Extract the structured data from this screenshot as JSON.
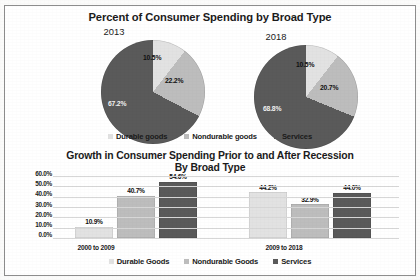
{
  "colors": {
    "durable": "#e2e2e2",
    "nondurable": "#bdbdbd",
    "services": "#5a5a5a",
    "grid": "#d7d7d7",
    "text": "#1b1b1b"
  },
  "pie_panel": {
    "title": "Percent of Consumer Spending by Broad Type",
    "charts": [
      {
        "year": "2013",
        "labels": [
          "10.5%",
          "22.2%",
          "67.2%"
        ]
      },
      {
        "year": "2018",
        "labels": [
          "10.5%",
          "20.7%",
          "68.8%"
        ]
      }
    ],
    "legend": [
      "Durable goods",
      "Nondurable goods",
      "Services"
    ]
  },
  "bar_panel": {
    "title_line1": "Growth in Consumer Spending Prior to and After Recession",
    "title_line2": "By Broad Type",
    "yticks": [
      "60.0%",
      "50.0%",
      "40.0%",
      "30.0%",
      "20.0%",
      "10.0%",
      "0.0%"
    ],
    "categories": [
      "2000 to 2009",
      "2009 to 2018"
    ],
    "legend": [
      "Durable Goods",
      "Nondurable Goods",
      "Services"
    ],
    "labels": {
      "g0": [
        "10.9%",
        "40.7%",
        "54.6%"
      ],
      "g1": [
        "44.2%",
        "32.9%",
        "44.0%"
      ]
    }
  },
  "chart_data": [
    {
      "type": "pie",
      "title": "Percent of Consumer Spending by Broad Type",
      "subtitle": "2013",
      "labels": [
        "Durable goods",
        "Nondurable goods",
        "Services"
      ],
      "values": [
        10.5,
        22.2,
        67.2
      ],
      "value_labels": [
        "10.5%",
        "22.2%",
        "67.2%"
      ],
      "legend_position": "bottom",
      "colors": [
        "#e2e2e2",
        "#bdbdbd",
        "#5a5a5a"
      ]
    },
    {
      "type": "pie",
      "title": "Percent of Consumer Spending by Broad Type",
      "subtitle": "2018",
      "labels": [
        "Durable goods",
        "Nondurable goods",
        "Services"
      ],
      "values": [
        10.5,
        20.7,
        68.8
      ],
      "value_labels": [
        "10.5%",
        "20.7%",
        "68.8%"
      ],
      "legend_position": "bottom",
      "colors": [
        "#e2e2e2",
        "#bdbdbd",
        "#5a5a5a"
      ]
    },
    {
      "type": "bar",
      "title": "Growth in Consumer Spending Prior to and After Recession By Broad Type",
      "categories": [
        "2000 to 2009",
        "2009 to 2018"
      ],
      "series": [
        {
          "name": "Durable Goods",
          "values": [
            10.9,
            44.2
          ],
          "color": "#e2e2e2"
        },
        {
          "name": "Nondurable Goods",
          "values": [
            40.7,
            32.9
          ],
          "color": "#bdbdbd"
        },
        {
          "name": "Services",
          "values": [
            54.6,
            44.0
          ],
          "color": "#5a5a5a"
        }
      ],
      "xlabel": "",
      "ylabel": "",
      "ylim": [
        0,
        60
      ],
      "ytick_values": [
        0,
        10,
        20,
        30,
        40,
        50,
        60
      ],
      "ytick_labels": [
        "0.0%",
        "10.0%",
        "20.0%",
        "30.0%",
        "40.0%",
        "50.0%",
        "60.0%"
      ],
      "grid": true,
      "legend_position": "bottom"
    }
  ]
}
